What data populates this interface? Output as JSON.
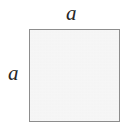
{
  "figure": {
    "kind": "square-with-side-labels",
    "background_color": "#ffffff",
    "shape": {
      "name": "square",
      "fill_color": "#f1f1f1",
      "stroke_color": "#8d8d8d",
      "stroke_width": 1
    },
    "labels": {
      "top": "a",
      "left": "a"
    },
    "label_color": "#262626"
  }
}
